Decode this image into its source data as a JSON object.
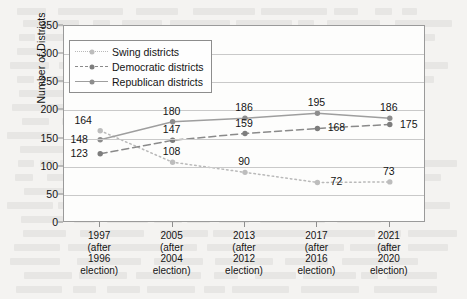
{
  "chart_data": {
    "type": "line",
    "title": "",
    "xlabel": "",
    "ylabel": "Number of Districts",
    "ylim": [
      0,
      350
    ],
    "yticks": [
      0,
      50,
      100,
      150,
      200,
      250,
      300,
      350
    ],
    "grid": true,
    "legend_position": "upper-left-inside",
    "categories": [
      "1997",
      "2005",
      "2013",
      "2017",
      "2021"
    ],
    "category_sublabels": [
      [
        "(after",
        "1996",
        "election)"
      ],
      [
        "(after",
        "2004",
        "election)"
      ],
      [
        "(after",
        "2012",
        "election)"
      ],
      [
        "(after",
        "2016",
        "election)"
      ],
      [
        "(after",
        "2020",
        "election)"
      ]
    ],
    "series": [
      {
        "name": "Swing districts",
        "style": "dotted",
        "color": "#b9b9b9",
        "values": [
          164,
          108,
          90,
          72,
          73
        ],
        "label_positions": [
          "above-left",
          "above",
          "above",
          "right",
          "above"
        ]
      },
      {
        "name": "Democratic districts",
        "style": "dashed",
        "color": "#8a8a8a",
        "values": [
          123,
          147,
          159,
          168,
          175
        ],
        "label_positions": [
          "left",
          "above",
          "above",
          "right",
          "right"
        ]
      },
      {
        "name": "Republican districts",
        "style": "solid",
        "color": "#9e9e9e",
        "values": [
          148,
          180,
          186,
          195,
          186
        ],
        "label_positions": [
          "left",
          "above",
          "above",
          "above",
          "above"
        ]
      }
    ]
  },
  "legend": {
    "items": [
      {
        "label": "Swing districts"
      },
      {
        "label": "Democratic districts"
      },
      {
        "label": "Republican districts"
      }
    ]
  }
}
